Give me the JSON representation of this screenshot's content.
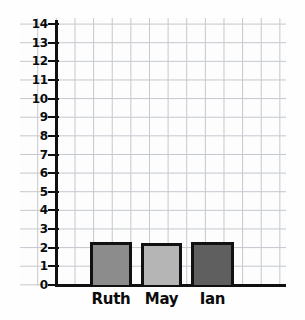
{
  "chart_data": {
    "type": "bar",
    "title": "",
    "xlabel": "",
    "ylabel": "",
    "categories": [
      "Ruth",
      "May",
      "Ian"
    ],
    "values": [
      2.3,
      2.25,
      2.3
    ],
    "series": [
      {
        "name": "",
        "values": [
          2.3,
          2.25,
          2.3
        ]
      }
    ],
    "ylim": [
      0,
      14
    ],
    "y_ticks": [
      0,
      1,
      2,
      3,
      4,
      5,
      6,
      7,
      8,
      9,
      10,
      11,
      12,
      13,
      14
    ],
    "y_tick_labels": [
      "0",
      "1",
      "2",
      "3",
      "4",
      "5",
      "6",
      "7",
      "8",
      "9",
      "10",
      "11",
      "12",
      "13",
      "14"
    ],
    "grid": true,
    "grid_style": "graph-paper",
    "legend": false,
    "legend_position": "none",
    "bar_colors": [
      "#8c8c8c",
      "#b5b5b5",
      "#5f5f5f"
    ],
    "bar_edge_color": "#111111",
    "grid_color": "#b9bfc6",
    "axis_color": "#101010",
    "background_color": "#fefefe"
  },
  "axis": {
    "y_labels": [
      {
        "value": "14"
      },
      {
        "value": "13"
      },
      {
        "value": "12"
      },
      {
        "value": "11"
      },
      {
        "value": "10"
      },
      {
        "value": "9"
      },
      {
        "value": "8"
      },
      {
        "value": "7"
      },
      {
        "value": "6"
      },
      {
        "value": "5"
      },
      {
        "value": "4"
      },
      {
        "value": "3"
      },
      {
        "value": "2"
      },
      {
        "value": "1"
      },
      {
        "value": "0"
      }
    ]
  },
  "bars": [
    {
      "label": "Ruth",
      "value": 2.3,
      "color": "#8c8c8c"
    },
    {
      "label": "May",
      "value": 2.25,
      "color": "#b5b5b5"
    },
    {
      "label": "Ian",
      "value": 2.3,
      "color": "#5f5f5f"
    }
  ]
}
